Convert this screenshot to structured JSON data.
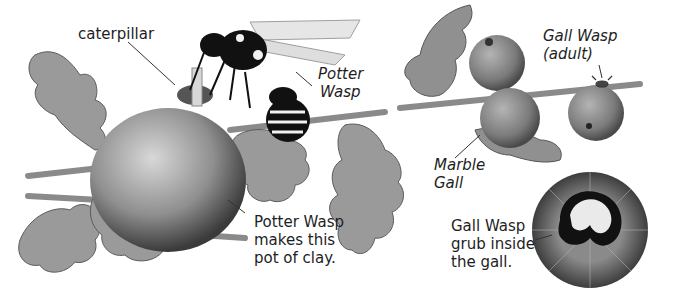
{
  "illustration": {
    "background": "#ffffff",
    "labels": {
      "caterpillar": "caterpillar",
      "potter_wasp_line1": "Potter",
      "potter_wasp_line2": "Wasp",
      "gall_wasp_adult_line1": "Gall Wasp",
      "gall_wasp_adult_line2": "(adult)",
      "marble_gall_line1": "Marble",
      "marble_gall_line2": "Gall",
      "pot_caption_line1": "Potter Wasp",
      "pot_caption_line2": "makes this",
      "pot_caption_line3": "pot of clay.",
      "grub_caption_line1": "Gall Wasp",
      "grub_caption_line2": "grub inside",
      "grub_caption_line3": "the gall."
    },
    "colors": {
      "leaf": "#9a9a9a",
      "leaf_dark": "#6e6e6e",
      "gall": "#8c8c8c",
      "pot": "#a8a8a8",
      "wasp_black": "#111111",
      "wasp_white": "#f2f2f2",
      "twig": "#8a8a8a",
      "text": "#1e1e1e"
    }
  }
}
